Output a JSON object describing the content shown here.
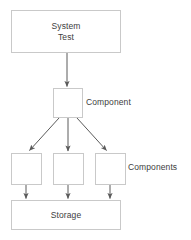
{
  "diagram": {
    "title": "",
    "colors": {
      "background": "#ffffff",
      "node_border": "#c9c9c9",
      "node_fill": "#ffffff",
      "text": "#3d3d3d",
      "edge": "#5a5a5a"
    },
    "nodes": [
      {
        "id": "system-test",
        "label": "System\nTest",
        "x": 11,
        "y": 10,
        "w": 110,
        "h": 43
      },
      {
        "id": "component",
        "label": "",
        "x": 53,
        "y": 88,
        "w": 30,
        "h": 30
      },
      {
        "id": "comp-1",
        "label": "",
        "x": 11,
        "y": 153,
        "w": 31,
        "h": 32
      },
      {
        "id": "comp-2",
        "label": "",
        "x": 53,
        "y": 153,
        "w": 31,
        "h": 32
      },
      {
        "id": "comp-3",
        "label": "",
        "x": 95,
        "y": 153,
        "w": 31,
        "h": 32
      },
      {
        "id": "storage",
        "label": "Storage",
        "x": 11,
        "y": 200,
        "w": 110,
        "h": 30
      }
    ],
    "annotations": [
      {
        "id": "component-annotation",
        "label": "Component",
        "x": 86,
        "y": 97
      },
      {
        "id": "components-annotation",
        "label": "Components",
        "x": 128,
        "y": 162
      }
    ],
    "edges": [
      {
        "from": "system-test",
        "to": "component",
        "arrow": true
      },
      {
        "from": "component",
        "to": "comp-1",
        "arrow": true
      },
      {
        "from": "component",
        "to": "comp-2",
        "arrow": true
      },
      {
        "from": "component",
        "to": "comp-3",
        "arrow": true
      },
      {
        "from": "comp-1",
        "to": "storage",
        "arrow": true
      },
      {
        "from": "comp-2",
        "to": "storage",
        "arrow": true
      },
      {
        "from": "comp-3",
        "to": "storage",
        "arrow": true
      }
    ]
  }
}
